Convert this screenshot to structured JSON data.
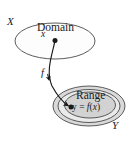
{
  "figure": {
    "type": "function-mapping-diagram",
    "labels": {
      "set_x": "X",
      "set_y": "Y",
      "domain": "Domain",
      "range": "Range",
      "input_point": "x",
      "map_name": "f",
      "output_point_prefix": "y = ",
      "output_point_fn": "f",
      "output_point_arg": "(x)",
      "output_point_full": "y = f(x)"
    },
    "colors": {
      "background": "#ffffff",
      "stroke": "#4a4a4a",
      "arrow": "#1a1a1a",
      "text": "#1a1a1a",
      "domain_fill": "#fdfdfd",
      "range_outer_fill": "#d8d8d8",
      "range_middle_fill": "#e8e8e8",
      "range_inner_fill": "#d0d0d0"
    },
    "geometry": {
      "domain_ellipse": {
        "cx": 55,
        "cy": 41,
        "rx": 40,
        "ry": 18
      },
      "range_outer_ellipse": {
        "cx": 89,
        "cy": 106,
        "rx": 36,
        "ry": 20
      },
      "range_middle_ellipse": {
        "cx": 89,
        "cy": 106,
        "rx": 31,
        "ry": 16.5
      },
      "range_inner_ellipse": {
        "cx": 90,
        "cy": 105,
        "rx": 25,
        "ry": 13
      },
      "input_dot": {
        "cx": 55,
        "cy": 40,
        "r": 2.4
      },
      "output_dot": {
        "cx": 71,
        "cy": 107,
        "r": 2.4
      },
      "arrow_path": "M 55,41 C 51,58 46,72 52,86 C 58,97 64,103 69,106"
    }
  }
}
